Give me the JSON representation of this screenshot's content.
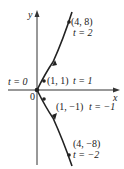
{
  "diagram": {
    "type": "parametric-curve",
    "axes": {
      "x_label": "x",
      "y_label": "y",
      "origin_label": "0"
    },
    "points": [
      {
        "coord": "(4, 8)",
        "param": "t = 2"
      },
      {
        "coord": "(1, 1)",
        "param": "t = 1"
      },
      {
        "coord": "",
        "param": "t = 0"
      },
      {
        "coord": "(1, −1)",
        "param": "t = −1"
      },
      {
        "coord": "(4, −8)",
        "param": "t = −2"
      }
    ],
    "colors": {
      "curve": "#222222",
      "axis": "#333333"
    }
  }
}
